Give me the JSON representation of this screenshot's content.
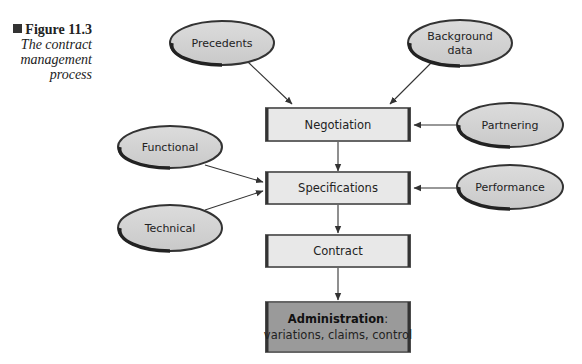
{
  "caption": {
    "figure_label": "Figure 11.3",
    "title_line1": "The contract",
    "title_line2": "management",
    "title_line3": "process"
  },
  "colors": {
    "ellipse_fill": "#d4d4d4",
    "ellipse_border": "#333333",
    "box_fill": "#e8e8e8",
    "box_border": "#555555",
    "admin_fill": "#9a9a9a",
    "arrow": "#333333"
  },
  "process_boxes": [
    {
      "id": "negotiation",
      "label": "Negotiation"
    },
    {
      "id": "specifications",
      "label": "Specifications"
    },
    {
      "id": "contract",
      "label": "Contract"
    },
    {
      "id": "administration",
      "label_bold": "Administration",
      "label_suffix": ":",
      "label_line2": "variations, claims, control"
    }
  ],
  "inputs": [
    {
      "id": "precedents",
      "label": "Precedents",
      "target": "negotiation"
    },
    {
      "id": "background-data",
      "label_line1": "Background",
      "label_line2": "data",
      "target": "negotiation"
    },
    {
      "id": "partnering",
      "label": "Partnering",
      "target": "negotiation"
    },
    {
      "id": "functional",
      "label": "Functional",
      "target": "specifications"
    },
    {
      "id": "technical",
      "label": "Technical",
      "target": "specifications"
    },
    {
      "id": "performance",
      "label": "Performance",
      "target": "specifications"
    }
  ]
}
